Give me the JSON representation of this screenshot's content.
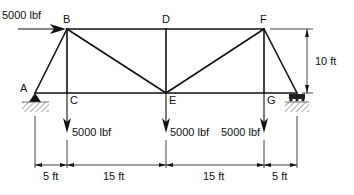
{
  "diagram": {
    "type": "truss",
    "nodes": [
      {
        "id": "A",
        "label": "A",
        "x": 35,
        "y": 93
      },
      {
        "id": "B",
        "label": "B",
        "x": 67,
        "y": 29
      },
      {
        "id": "C",
        "label": "C",
        "x": 67,
        "y": 93
      },
      {
        "id": "D",
        "label": "D",
        "x": 166,
        "y": 29
      },
      {
        "id": "E",
        "label": "E",
        "x": 166,
        "y": 93
      },
      {
        "id": "F",
        "label": "F",
        "x": 264,
        "y": 29
      },
      {
        "id": "G",
        "label": "G",
        "x": 264,
        "y": 93
      },
      {
        "id": "H",
        "label": "",
        "x": 297,
        "y": 93
      }
    ],
    "members": [
      [
        "A",
        "B"
      ],
      [
        "B",
        "D"
      ],
      [
        "D",
        "F"
      ],
      [
        "F",
        "H"
      ],
      [
        "A",
        "C"
      ],
      [
        "C",
        "E"
      ],
      [
        "E",
        "G"
      ],
      [
        "G",
        "H"
      ],
      [
        "B",
        "C"
      ],
      [
        "D",
        "E"
      ],
      [
        "F",
        "G"
      ],
      [
        "B",
        "E"
      ],
      [
        "E",
        "F"
      ]
    ],
    "supports": [
      {
        "node": "A",
        "type": "pin"
      },
      {
        "node": "H",
        "type": "roller"
      }
    ],
    "loads": [
      {
        "node": "B",
        "direction": "right",
        "label": "5000 lbf"
      },
      {
        "node": "C",
        "direction": "down",
        "label": "5000 lbf"
      },
      {
        "node": "E",
        "direction": "down",
        "label": "5000 lbf"
      },
      {
        "node": "G",
        "direction": "down",
        "label": "5000 lbf"
      }
    ],
    "dimensions": {
      "horizontal": [
        {
          "from": "A",
          "to": "C",
          "label": "5 ft"
        },
        {
          "from": "C",
          "to": "E",
          "label": "15 ft"
        },
        {
          "from": "E",
          "to": "G",
          "label": "15 ft"
        },
        {
          "from": "G",
          "to": "H",
          "label": "5 ft"
        }
      ],
      "vertical": {
        "label": "10 ft"
      }
    }
  }
}
